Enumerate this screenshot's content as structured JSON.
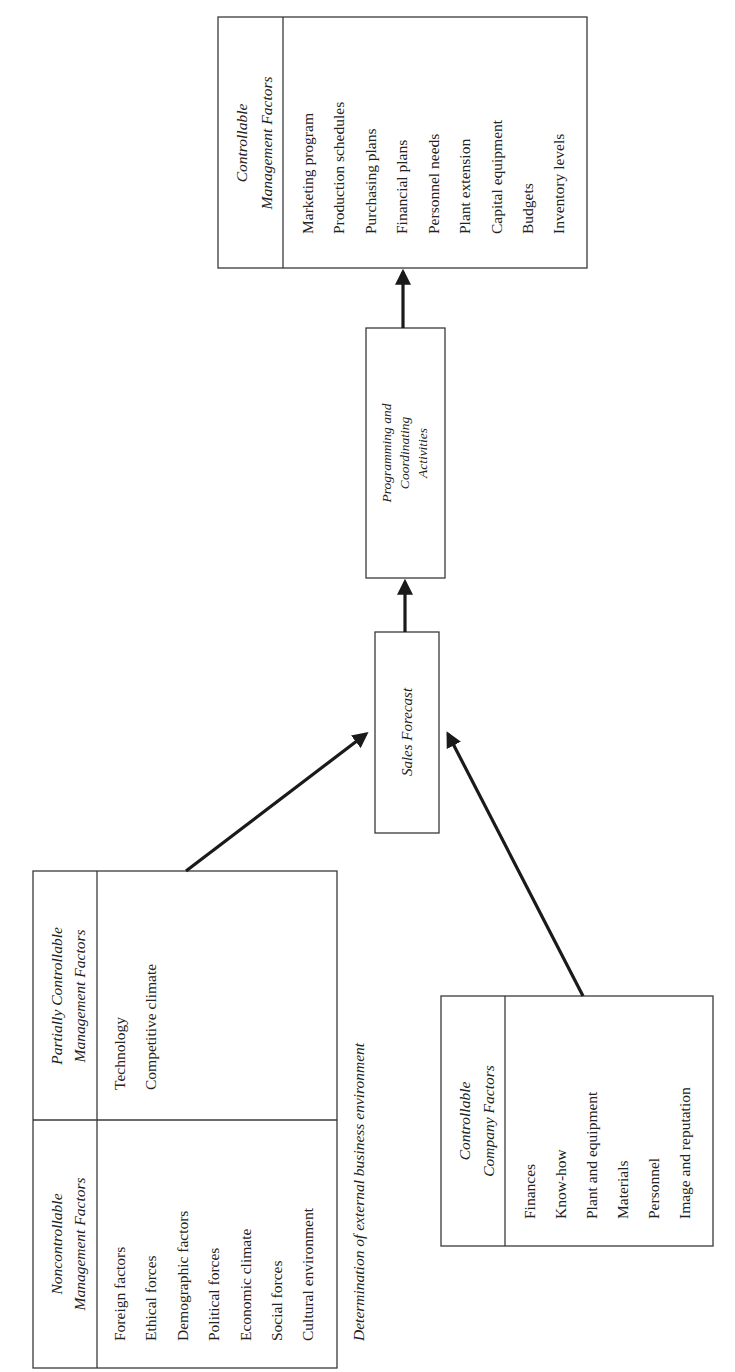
{
  "diagram": {
    "orientation": "rotated-90-ccw",
    "noncontrollable": {
      "header_line1": "Noncontrollable",
      "header_line2": "Management Factors",
      "items": [
        "Foreign factors",
        "Ethical forces",
        "Demographic factors",
        "Political forces",
        "Economic climate",
        "Social forces",
        "Cultural environment"
      ]
    },
    "partially_controllable": {
      "header_line1": "Partially Controllable",
      "header_line2": "Management Factors",
      "items": [
        "Technology",
        "Competitive climate"
      ]
    },
    "environment_caption": "Determination of external business environment",
    "company_factors": {
      "header_line1": "Controllable",
      "header_line2": "Company Factors",
      "items": [
        "Finances",
        "Know-how",
        "Plant and equipment",
        "Materials",
        "Personnel",
        "Image and reputation"
      ]
    },
    "sales_forecast": {
      "label": "Sales Forecast"
    },
    "programming": {
      "line1": "Programming and",
      "line2": "Coordinating",
      "line3": "Activities"
    },
    "controllable_management": {
      "header_line1": "Controllable",
      "header_line2": "Management Factors",
      "items": [
        "Marketing program",
        "Production schedules",
        "Purchasing plans",
        "Financial plans",
        "Personnel needs",
        "Plant extension",
        "Capital equipment",
        "Budgets",
        "Inventory levels"
      ]
    },
    "edges": [
      {
        "from": "external-environment",
        "to": "sales-forecast"
      },
      {
        "from": "company-factors",
        "to": "sales-forecast"
      },
      {
        "from": "sales-forecast",
        "to": "programming-activities"
      },
      {
        "from": "programming-activities",
        "to": "controllable-management-factors"
      }
    ]
  }
}
